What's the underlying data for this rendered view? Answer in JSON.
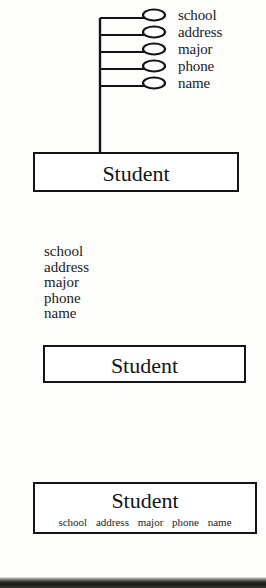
{
  "figure": {
    "entity_name": "Student",
    "attributes": [
      "school",
      "address",
      "major",
      "phone",
      "name"
    ],
    "colors": {
      "ink": "#141414",
      "paper": "#fdfdfc"
    }
  },
  "diagram1": {
    "entity_label": "Student",
    "attribute_labels": [
      "school",
      "address",
      "major",
      "phone",
      "name"
    ],
    "notation": "ellipse-attributes-connected-by-lines"
  },
  "diagram2": {
    "entity_label": "Student",
    "attribute_labels": [
      "school",
      "address",
      "major",
      "phone",
      "name"
    ],
    "notation": "attribute-list-above-entity-box"
  },
  "diagram3": {
    "entity_label": "Student",
    "attribute_labels": [
      "school",
      "address",
      "major",
      "phone",
      "name"
    ],
    "notation": "attributes-inside-entity-box"
  }
}
